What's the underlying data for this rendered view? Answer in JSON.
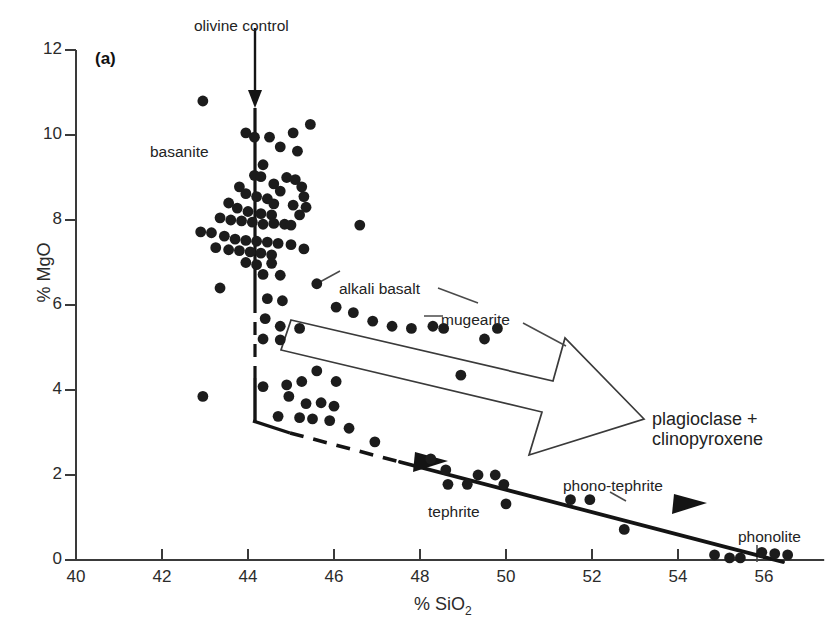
{
  "panel": {
    "label": "(a)"
  },
  "axes": {
    "x": {
      "title": "% SiO",
      "title_sub": "2",
      "ticks": [
        40,
        42,
        44,
        46,
        48,
        50,
        52,
        54,
        56
      ],
      "min": 40,
      "max": 57.4
    },
    "y": {
      "title": "% MgO",
      "ticks": [
        0,
        2,
        4,
        6,
        8,
        10,
        12
      ],
      "min": 0,
      "max": 12
    },
    "axis_color": "#3a3a3a"
  },
  "annotations": {
    "olivine_control": "olivine control",
    "basanite": "basanite",
    "alkali_basalt": "alkali basalt",
    "mugearite": "mugearite",
    "tephrite": "tephrite",
    "phono_tephrite": "phono-tephrite",
    "phonolite": "phonolite",
    "plagioclase_line1": "plagioclase +",
    "plagioclase_line2": "clinopyroxene"
  },
  "style": {
    "marker_color": "#1c1c1c",
    "marker_radius": 5.4,
    "line_color": "#141414",
    "leader_color": "#4a4a4a"
  },
  "chart_data": {
    "type": "scatter",
    "title": "",
    "xlabel": "% SiO2",
    "ylabel": "% MgO",
    "xlim": [
      40,
      57.4
    ],
    "ylim": [
      0,
      12
    ],
    "grid": false,
    "legend": null,
    "xticks": [
      40,
      42,
      44,
      46,
      48,
      50,
      52,
      54,
      56
    ],
    "yticks": [
      0,
      2,
      4,
      6,
      8,
      10,
      12
    ],
    "series": [
      {
        "name": "volcanic rock analyses",
        "marker": "filled-circle",
        "color": "#1c1c1c",
        "points": [
          [
            42.95,
            10.8
          ],
          [
            43.95,
            10.05
          ],
          [
            44.15,
            9.95
          ],
          [
            44.5,
            9.95
          ],
          [
            45.05,
            10.05
          ],
          [
            45.45,
            10.25
          ],
          [
            44.75,
            9.72
          ],
          [
            45.15,
            9.62
          ],
          [
            44.35,
            9.3
          ],
          [
            44.15,
            9.05
          ],
          [
            44.3,
            9.02
          ],
          [
            44.9,
            9.0
          ],
          [
            45.1,
            8.95
          ],
          [
            45.25,
            8.78
          ],
          [
            44.6,
            8.85
          ],
          [
            44.75,
            8.68
          ],
          [
            43.8,
            8.78
          ],
          [
            43.95,
            8.62
          ],
          [
            44.2,
            8.55
          ],
          [
            44.45,
            8.5
          ],
          [
            44.6,
            8.38
          ],
          [
            43.55,
            8.4
          ],
          [
            43.75,
            8.28
          ],
          [
            44.0,
            8.2
          ],
          [
            44.3,
            8.15
          ],
          [
            44.55,
            8.12
          ],
          [
            45.05,
            8.35
          ],
          [
            45.2,
            8.12
          ],
          [
            45.3,
            8.55
          ],
          [
            45.35,
            8.3
          ],
          [
            43.35,
            8.05
          ],
          [
            43.6,
            8.0
          ],
          [
            43.85,
            7.98
          ],
          [
            44.1,
            7.95
          ],
          [
            44.35,
            7.9
          ],
          [
            44.6,
            7.92
          ],
          [
            44.85,
            7.9
          ],
          [
            45.0,
            7.88
          ],
          [
            42.9,
            7.72
          ],
          [
            43.15,
            7.7
          ],
          [
            43.45,
            7.62
          ],
          [
            43.7,
            7.55
          ],
          [
            43.95,
            7.52
          ],
          [
            44.2,
            7.5
          ],
          [
            44.45,
            7.48
          ],
          [
            44.7,
            7.45
          ],
          [
            45.0,
            7.42
          ],
          [
            43.25,
            7.35
          ],
          [
            43.55,
            7.3
          ],
          [
            43.8,
            7.28
          ],
          [
            44.05,
            7.25
          ],
          [
            44.3,
            7.22
          ],
          [
            44.55,
            7.18
          ],
          [
            45.3,
            7.32
          ],
          [
            43.95,
            7.0
          ],
          [
            44.2,
            6.95
          ],
          [
            44.55,
            6.98
          ],
          [
            44.35,
            6.72
          ],
          [
            44.75,
            6.7
          ],
          [
            43.35,
            6.4
          ],
          [
            44.45,
            6.15
          ],
          [
            44.8,
            6.1
          ],
          [
            45.6,
            6.5
          ],
          [
            44.4,
            5.68
          ],
          [
            44.75,
            5.5
          ],
          [
            45.2,
            5.45
          ],
          [
            44.35,
            5.2
          ],
          [
            44.75,
            5.18
          ],
          [
            46.6,
            7.88
          ],
          [
            46.05,
            5.95
          ],
          [
            46.45,
            5.82
          ],
          [
            46.9,
            5.62
          ],
          [
            47.35,
            5.5
          ],
          [
            47.8,
            5.45
          ],
          [
            48.3,
            5.5
          ],
          [
            48.55,
            5.45
          ],
          [
            49.8,
            5.45
          ],
          [
            49.5,
            5.2
          ],
          [
            42.95,
            3.85
          ],
          [
            44.35,
            4.08
          ],
          [
            44.9,
            4.12
          ],
          [
            45.25,
            4.2
          ],
          [
            45.6,
            4.45
          ],
          [
            46.05,
            4.2
          ],
          [
            44.95,
            3.85
          ],
          [
            45.35,
            3.68
          ],
          [
            45.7,
            3.7
          ],
          [
            46.0,
            3.62
          ],
          [
            48.95,
            4.35
          ],
          [
            44.7,
            3.38
          ],
          [
            45.2,
            3.35
          ],
          [
            45.5,
            3.32
          ],
          [
            45.9,
            3.28
          ],
          [
            46.35,
            3.1
          ],
          [
            46.95,
            2.78
          ],
          [
            48.25,
            2.38
          ],
          [
            48.6,
            2.12
          ],
          [
            49.35,
            2.0
          ],
          [
            49.75,
            2.0
          ],
          [
            48.65,
            1.78
          ],
          [
            49.1,
            1.78
          ],
          [
            49.95,
            1.78
          ],
          [
            50.0,
            1.32
          ],
          [
            51.5,
            1.42
          ],
          [
            51.95,
            1.42
          ],
          [
            52.75,
            0.72
          ],
          [
            54.85,
            0.12
          ],
          [
            55.2,
            0.05
          ],
          [
            55.45,
            0.05
          ],
          [
            55.95,
            0.18
          ],
          [
            56.25,
            0.15
          ],
          [
            56.55,
            0.12
          ]
        ]
      }
    ],
    "trend_lines": [
      {
        "name": "olivine control line",
        "style": "solid-then-dashed vertical",
        "from": [
          44.2,
          12.2
        ],
        "to": [
          44.2,
          3.3
        ],
        "arrow": "down"
      },
      {
        "name": "plagioclase + clinopyroxene fractionation trend",
        "style": "dashed then solid",
        "from": [
          44.2,
          3.3
        ],
        "to": [
          56.1,
          0.0
        ],
        "arrows": [
          "mid-left",
          "mid-right"
        ]
      }
    ]
  }
}
